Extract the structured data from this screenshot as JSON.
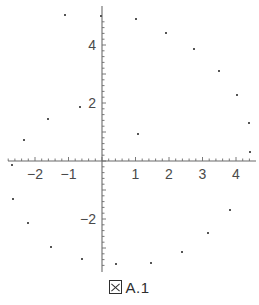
{
  "figure": {
    "caption_prefix_icon": "tofu-box-glyph",
    "caption": "A.1",
    "caption_full": "図 A.1"
  },
  "chart_data": {
    "type": "scatter",
    "title": "",
    "xlabel": "",
    "ylabel": "",
    "xlim": [
      -2.9,
      4.5
    ],
    "ylim": [
      -3.6,
      4.9
    ],
    "grid": false,
    "legend": null,
    "axis_color": "#6b6b6b",
    "point_color": "#555555",
    "point_size_px": 2,
    "xticks": [
      -2,
      -1,
      1,
      2,
      3,
      4
    ],
    "xtick_labels": [
      "-2",
      "-1",
      "1",
      "2",
      "3",
      "4"
    ],
    "yticks": [
      2,
      4,
      -2
    ],
    "ytick_labels": [
      "2",
      "4",
      "-2"
    ],
    "minor_tick_spacing": 0.2,
    "x_axis_range_px": [
      8,
      256
    ],
    "y_axis_range_px": [
      6,
      272
    ],
    "origin_px": [
      102,
      161
    ],
    "x_scale_px_per_unit": 33.5,
    "y_scale_px_per_unit": 29.0,
    "points": [
      {
        "x": -1.1,
        "y": 5.03
      },
      {
        "x": -0.03,
        "y": 5.0
      },
      {
        "x": 1.01,
        "y": 4.9
      },
      {
        "x": 1.91,
        "y": 4.41
      },
      {
        "x": 2.75,
        "y": 3.86
      },
      {
        "x": 3.49,
        "y": 3.1
      },
      {
        "x": 4.03,
        "y": 2.28
      },
      {
        "x": 4.39,
        "y": 1.31
      },
      {
        "x": 4.42,
        "y": 0.31
      },
      {
        "x": 1.07,
        "y": 0.93
      },
      {
        "x": -0.66,
        "y": 1.86
      },
      {
        "x": -1.61,
        "y": 1.45
      },
      {
        "x": -2.33,
        "y": 0.72
      },
      {
        "x": -2.69,
        "y": -0.14
      },
      {
        "x": -2.66,
        "y": -1.31
      },
      {
        "x": -2.21,
        "y": -2.14
      },
      {
        "x": -1.52,
        "y": -2.97
      },
      {
        "x": -0.6,
        "y": -3.38
      },
      {
        "x": 0.42,
        "y": -3.55
      },
      {
        "x": 1.46,
        "y": -3.52
      },
      {
        "x": 2.39,
        "y": -3.14
      },
      {
        "x": 3.16,
        "y": -2.48
      },
      {
        "x": 3.82,
        "y": -1.69
      }
    ],
    "points_px": [
      [
        65,
        15
      ],
      [
        101,
        16
      ],
      [
        136,
        19
      ],
      [
        166,
        33
      ],
      [
        194,
        49
      ],
      [
        219,
        71
      ],
      [
        237,
        95
      ],
      [
        249,
        123
      ],
      [
        250,
        152
      ],
      [
        138,
        134
      ],
      [
        80,
        107
      ],
      [
        48,
        119
      ],
      [
        24,
        140
      ],
      [
        12,
        165
      ],
      [
        13,
        199
      ],
      [
        28,
        223
      ],
      [
        51,
        247
      ],
      [
        82,
        259
      ],
      [
        116,
        264
      ],
      [
        151,
        263
      ],
      [
        182,
        252
      ],
      [
        208,
        233
      ],
      [
        230,
        210
      ]
    ]
  }
}
